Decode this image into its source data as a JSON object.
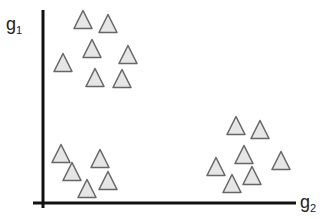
{
  "chart_data": {
    "type": "scatter",
    "title": "",
    "xlabel": "g2",
    "ylabel": "g1",
    "grid": false,
    "legend": null,
    "marker": "triangle",
    "marker_fill": "#e6e6e6",
    "marker_stroke": "#666666",
    "axis_color": "#111111",
    "clusters": [
      {
        "name": "top-left",
        "points": [
          [
            83,
            20
          ],
          [
            108,
            24
          ],
          [
            92,
            49
          ],
          [
            128,
            55
          ],
          [
            63,
            63
          ],
          [
            95,
            78
          ],
          [
            122,
            79
          ]
        ]
      },
      {
        "name": "bottom-left",
        "points": [
          [
            61,
            154
          ],
          [
            100,
            159
          ],
          [
            72,
            172
          ],
          [
            108,
            181
          ],
          [
            87,
            189
          ]
        ]
      },
      {
        "name": "bottom-right",
        "points": [
          [
            236,
            126
          ],
          [
            260,
            130
          ],
          [
            244,
            155
          ],
          [
            281,
            161
          ],
          [
            216,
            167
          ],
          [
            252,
            176
          ],
          [
            232,
            184
          ]
        ]
      }
    ]
  },
  "labels": {
    "y_main": "g",
    "y_sub": "1",
    "x_main": "g",
    "x_sub": "2"
  }
}
